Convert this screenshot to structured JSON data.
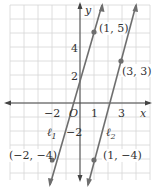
{
  "chart_data": {
    "type": "line",
    "title": "",
    "xlabel": "x",
    "ylabel": "y",
    "xlim": [
      -5.5,
      5.5
    ],
    "ylim": [
      -5.5,
      7.3
    ],
    "grid": true,
    "x_ticks": [
      "-2",
      "1",
      "3"
    ],
    "y_ticks": [
      "4",
      "2",
      "-2"
    ],
    "origin_label": "O",
    "series": [
      {
        "name": "ℓ1",
        "label_main": "ℓ",
        "label_sub": "1",
        "points": [
          [
            -2,
            -4
          ],
          [
            1,
            5
          ]
        ],
        "point_labels": [
          "(-2, -4)",
          "(1, 5)"
        ],
        "slope": 3
      },
      {
        "name": "ℓ2",
        "label_main": "ℓ",
        "label_sub": "2",
        "points": [
          [
            1,
            -4
          ],
          [
            3,
            3
          ]
        ],
        "point_labels": [
          "(1, -4)",
          "(3, 3)"
        ],
        "slope": 3.5
      }
    ]
  },
  "colors": {
    "grid": "#d6d6d6",
    "axis": "#444444",
    "line": "#6e6e6e",
    "point": "#6e6e6e",
    "text": "#333333"
  }
}
